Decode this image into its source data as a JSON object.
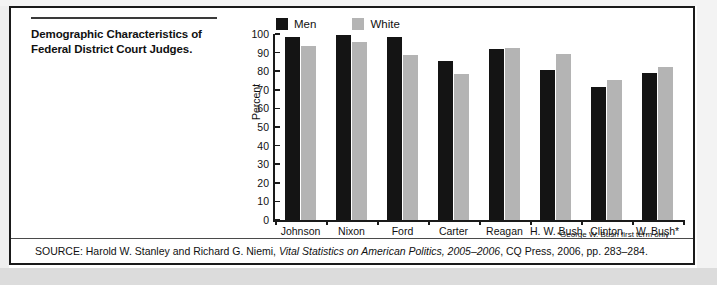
{
  "figure": {
    "title": "Demographic Characteristics of Federal District Court Judges.",
    "title_line1": "Demographic Characteristics of",
    "title_line2": "Federal District Court Judges.",
    "footnote": "*George W. Bush first term only",
    "source_prefix": "SOURCE:  Harold W. Stanley and Richard G. Niemi, ",
    "source_italic": "Vital Statistics on American Politics, 2005–2006",
    "source_suffix": ", CQ Press, 2006, pp. 283–284."
  },
  "colors": {
    "men": "#141414",
    "white": "#b4b4b4",
    "axis": "#1a1a1a",
    "border": "#1a1a1a",
    "text": "#111111"
  },
  "chart_data": {
    "type": "bar",
    "title": "Demographic Characteristics of Federal District Court Judges.",
    "xlabel": "",
    "ylabel": "Percent",
    "ylim": [
      0,
      100
    ],
    "yticks": [
      0,
      10,
      20,
      30,
      40,
      50,
      60,
      70,
      80,
      90,
      100
    ],
    "ytick_labels": [
      "0",
      "10",
      "20",
      "30",
      "40",
      "50",
      "60",
      "70",
      "80",
      "90",
      "100"
    ],
    "grid": false,
    "legend_position": "top-center",
    "categories": [
      "Johnson",
      "Nixon",
      "Ford",
      "Carter",
      "Reagan",
      "H. W. Bush",
      "Clinton",
      "W. Bush*"
    ],
    "series": [
      {
        "name": "Men",
        "color": "#141414",
        "values": [
          98.4,
          99.5,
          98.4,
          85.6,
          91.7,
          80.4,
          71.5,
          79.3
        ]
      },
      {
        "name": "White",
        "color": "#b4b4b4",
        "values": [
          93.4,
          95.5,
          88.5,
          78.5,
          92.6,
          89.2,
          75.1,
          82.0
        ]
      }
    ]
  }
}
